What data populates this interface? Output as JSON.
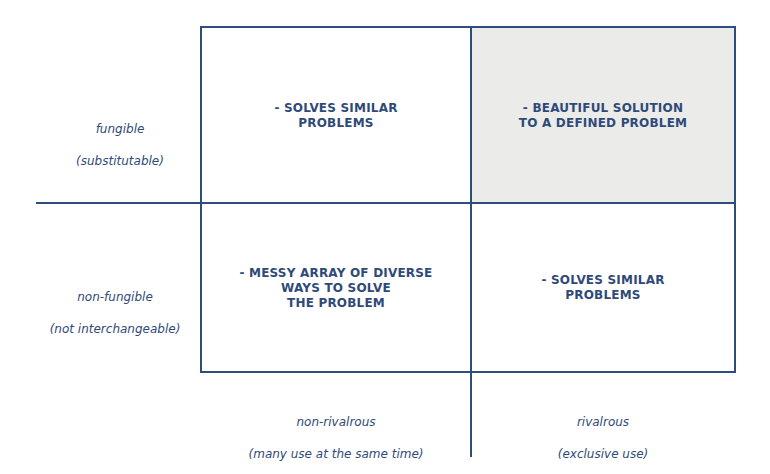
{
  "diagram": {
    "title": "",
    "colors": {
      "line": "#2f4d7c",
      "text": "#2f4a78",
      "highlight": "#ebebea"
    },
    "row_labels": [
      {
        "term": "fungible",
        "gloss": "(substitutable)"
      },
      {
        "term": "non-fungible",
        "gloss": "(not interchangeable)"
      }
    ],
    "column_labels": [
      {
        "term": "non-rivalrous",
        "gloss": "(many use at the same time)"
      },
      {
        "term": "rivalrous",
        "gloss": "(exclusive use)"
      }
    ],
    "cells": {
      "top_left": "- SOLVES SIMILAR\nPROBLEMS",
      "top_right": "- BEAUTIFUL SOLUTION\nTO A DEFINED PROBLEM",
      "bottom_left": "- MESSY ARRAY OF DIVERSE\nWAYS TO SOLVE\nTHE PROBLEM",
      "bottom_right": "- SOLVES SIMILAR\nPROBLEMS"
    },
    "highlighted_cell": "top_right"
  }
}
